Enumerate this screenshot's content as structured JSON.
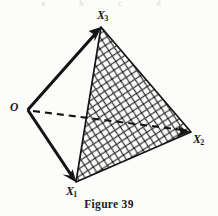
{
  "figure": {
    "caption": "Figure 39",
    "top_bleed_artifact": "a b c d",
    "background_color": "#fcfcfb",
    "ink_color": "#141414",
    "labels": {
      "origin": {
        "text": "O",
        "name": "vertex-label-o"
      },
      "x1": {
        "base": "X",
        "subscript": "1"
      },
      "x2": {
        "base": "X",
        "subscript": "2"
      },
      "x3": {
        "base": "X",
        "subscript": "3"
      }
    },
    "geometry": {
      "vertices": {
        "O": {
          "x": 28,
          "y": 110
        },
        "X1": {
          "x": 76,
          "y": 182
        },
        "X2": {
          "x": 191,
          "y": 132
        },
        "X3": {
          "x": 101,
          "y": 27
        }
      },
      "edges": [
        {
          "from": "O",
          "to": "X3",
          "style": "solid",
          "arrow": true,
          "width": 3.0
        },
        {
          "from": "O",
          "to": "X1",
          "style": "solid",
          "arrow": true,
          "width": 3.0
        },
        {
          "from": "O",
          "to": "X2",
          "style": "dashed",
          "arrow": true,
          "width": 2.0
        },
        {
          "from": "X3",
          "to": "X2",
          "style": "solid",
          "arrow": false,
          "width": 1.6
        },
        {
          "from": "X2",
          "to": "X1",
          "style": "solid",
          "arrow": false,
          "width": 1.6
        },
        {
          "from": "X1",
          "to": "X3",
          "style": "solid",
          "arrow": false,
          "width": 1.6
        }
      ],
      "hatched_face": [
        "X1",
        "X2",
        "X3"
      ],
      "hatch": {
        "pattern": "crosshatch",
        "spacing_px": 9,
        "stroke_width": 1.1,
        "angles_deg": [
          45,
          -45
        ]
      },
      "dash_pattern": "7 5"
    }
  }
}
